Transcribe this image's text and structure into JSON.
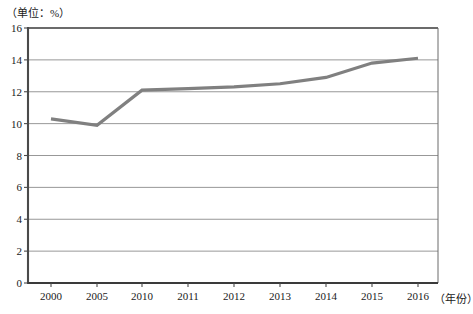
{
  "chart_data": {
    "type": "line",
    "title": "",
    "unit_label": "（单位：%）",
    "xlabel": "（年份）",
    "ylabel": "",
    "categories": [
      "2000",
      "2005",
      "2010",
      "2011",
      "2012",
      "2013",
      "2014",
      "2015",
      "2016"
    ],
    "values": [
      10.3,
      9.9,
      12.1,
      12.2,
      12.3,
      12.5,
      12.9,
      13.8,
      14.1
    ],
    "series": [
      {
        "name": "",
        "values": [
          10.3,
          9.9,
          12.1,
          12.2,
          12.3,
          12.5,
          12.9,
          13.8,
          14.1
        ]
      }
    ],
    "ylim": [
      0,
      16
    ],
    "ytick_labels": [
      "0",
      "2",
      "4",
      "6",
      "8",
      "10",
      "12",
      "14",
      "16"
    ],
    "ytick_values": [
      0,
      2,
      4,
      6,
      8,
      10,
      12,
      14,
      16
    ],
    "grid": "horizontal",
    "legend": "none",
    "line_color": "#808080",
    "gridline_color": "#8c8c8c",
    "axis_color": "#404040"
  },
  "geometry": {
    "plot_left": 28,
    "plot_right": 438,
    "plot_top": 28,
    "plot_bottom": 283,
    "x_positions": [
      51,
      97,
      142,
      188,
      234,
      280,
      326,
      372,
      418
    ]
  }
}
